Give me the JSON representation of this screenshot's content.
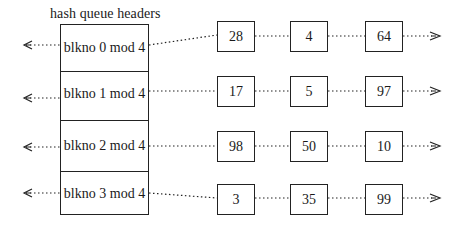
{
  "title": "hash queue headers",
  "headers": [
    {
      "label": "blkno 0 mod 4",
      "nodes": [
        "28",
        "4",
        "64"
      ]
    },
    {
      "label": "blkno 1 mod 4",
      "nodes": [
        "17",
        "5",
        "97"
      ]
    },
    {
      "label": "blkno 2 mod 4",
      "nodes": [
        "98",
        "50",
        "10"
      ]
    },
    {
      "label": "blkno 3 mod 4",
      "nodes": [
        "3",
        "35",
        "99"
      ]
    }
  ],
  "icons": {
    "left_arrow": "arrow-left-icon",
    "right_arrow": "arrow-right-icon"
  },
  "colors": {
    "line": "#222222",
    "background": "#ffffff"
  }
}
